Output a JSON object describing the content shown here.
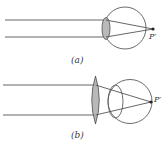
{
  "diagram": {
    "panels": [
      {
        "id": "a",
        "caption": "(a)",
        "point_label": "P′",
        "description": "Eye focusing parallel rays with its own lens; image point P′ lies beyond the retina"
      },
      {
        "id": "b",
        "caption": "(b)",
        "point_label": "P′",
        "description": "Converging corrective lens in front of the eye brings focus onto the retina at P′"
      }
    ],
    "colors": {
      "line": "#555555",
      "lens_fill": "#b9b9b9",
      "lens_stroke": "#4a4a4a",
      "eye_stroke": "#5a5a5a",
      "point": "#222222",
      "text": "#3a3a3a"
    }
  }
}
